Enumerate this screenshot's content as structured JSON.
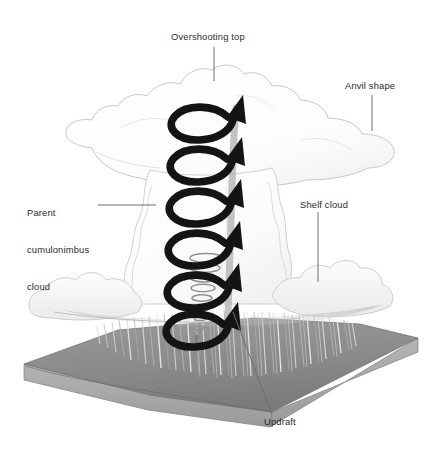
{
  "figure": {
    "title_alt": "Supercell thunderstorm anatomy diagram",
    "background_color": "#ffffff",
    "label_color": "#2b2b2b",
    "leader_line_color": "#6f6f6f",
    "arrow_color": "#151515",
    "ground_top_color": "#8f8f8f",
    "ground_side_color": "#a8a8a8",
    "cloud_outline_color": "#b9bcbe",
    "cloud_fill_color": "#fbfcfc",
    "rain_color": "#9aa0a4"
  },
  "labels": {
    "overshooting_top": "Overshooting top",
    "anvil_shape": "Anvil shape",
    "parent_cloud_line1": "Parent",
    "parent_cloud_line2": "cumulonimbus",
    "parent_cloud_line3": "cloud",
    "shelf_cloud": "Shelf cloud",
    "updraft": "Updraft"
  },
  "elements": {
    "helix_loop_count": 6,
    "arrowhead_count": 6,
    "rain_streak_count": 46
  }
}
